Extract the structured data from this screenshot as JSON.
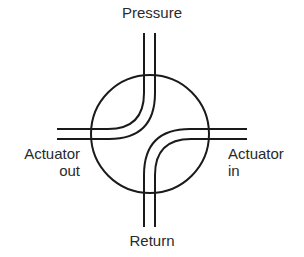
{
  "diagram": {
    "labels": {
      "top": "Pressure",
      "bottom": "Return",
      "left_line1": "Actuator",
      "left_line2": "out",
      "right_line1": "Actuator",
      "right_line2": "in"
    },
    "colors": {
      "stroke": "#1a1a1a",
      "text": "#2a2a2a",
      "background": "#ffffff"
    },
    "connections": [
      {
        "from": "Pressure",
        "to": "Actuator out"
      },
      {
        "from": "Actuator in",
        "to": "Return"
      }
    ]
  }
}
